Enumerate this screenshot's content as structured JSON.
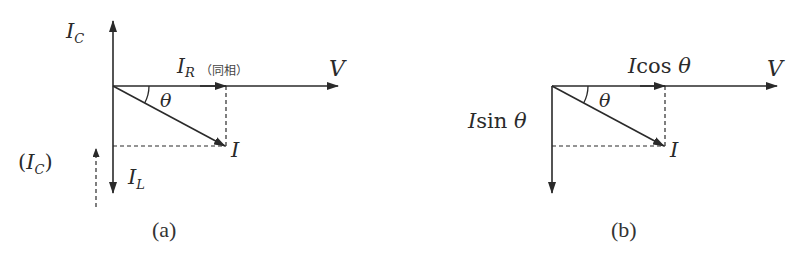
{
  "figure": {
    "stroke_color": "#2a2a2a",
    "background": "#ffffff"
  },
  "panel_a": {
    "caption": "(a)",
    "labels": {
      "ic_top": "I",
      "ic_top_sub": "C",
      "ir": "I",
      "ir_sub": "R",
      "ir_note": "（同相）",
      "v": "V",
      "theta": "θ",
      "i": "I",
      "il": "I",
      "il_sub": "L",
      "ic_paren_open": "(",
      "ic_paren": "I",
      "ic_paren_sub": "C",
      "ic_paren_close": ")"
    }
  },
  "panel_b": {
    "caption": "(b)",
    "labels": {
      "icos": "Icos θ",
      "v": "V",
      "theta": "θ",
      "isin": "Isin θ",
      "i": "I"
    }
  }
}
